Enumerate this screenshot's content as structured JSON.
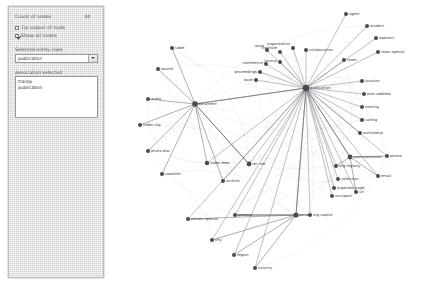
{
  "panel": {
    "count_label": "Count of nodes",
    "count_value": "44",
    "checkbox_top_label": "Tip output of node",
    "checkbox_top_checked": false,
    "checkbox_show_label": "Show all nodes",
    "checkbox_show_checked": true,
    "select_label": "Selected entity class",
    "select_value": "publication",
    "list_label": "Association selected",
    "list_items": [
      "transp",
      "publication"
    ]
  },
  "graph": {
    "accent_node_color": "#4a4a52",
    "edge_color": "#6f6f78",
    "hub_center": {
      "label": "publication",
      "x": 196,
      "y": 88
    },
    "nodes": [
      {
        "id": "n01",
        "label": "agent",
        "x": 236,
        "y": 14,
        "r": 2.0,
        "anchor": "start",
        "dx": 3,
        "dy": 1.2
      },
      {
        "id": "n02",
        "label": "student",
        "x": 257,
        "y": 26,
        "r": 2.0,
        "anchor": "start",
        "dx": 3,
        "dy": 1.2
      },
      {
        "id": "n03",
        "label": "aspirant",
        "x": 266,
        "y": 38,
        "r": 2.0,
        "anchor": "start",
        "dx": 3,
        "dy": 1.2
      },
      {
        "id": "n04",
        "label": "team special",
        "x": 268,
        "y": 52,
        "r": 2.0,
        "anchor": "start",
        "dx": 3,
        "dy": 1.2
      },
      {
        "id": "n05",
        "label": "team",
        "x": 234,
        "y": 60,
        "r": 2.0,
        "anchor": "start",
        "dx": 3,
        "dy": 1.2
      },
      {
        "id": "n06",
        "label": "location",
        "x": 252,
        "y": 81,
        "r": 2.0,
        "anchor": "start",
        "dx": 3,
        "dy": 1.2
      },
      {
        "id": "n07",
        "label": "post address",
        "x": 254,
        "y": 94,
        "r": 2.0,
        "anchor": "start",
        "dx": 3,
        "dy": 1.2
      },
      {
        "id": "n08",
        "label": "naming",
        "x": 252,
        "y": 107,
        "r": 2.0,
        "anchor": "start",
        "dx": 3,
        "dy": 1.2
      },
      {
        "id": "n09",
        "label": "calling",
        "x": 252,
        "y": 120,
        "r": 2.0,
        "anchor": "start",
        "dx": 3,
        "dy": 1.2
      },
      {
        "id": "n10",
        "label": "authorship",
        "x": 250,
        "y": 133,
        "r": 2.0,
        "anchor": "start",
        "dx": 3,
        "dy": 1.2
      },
      {
        "id": "n11",
        "label": "communication",
        "x": 240,
        "y": 157,
        "r": 2.4,
        "anchor": "start",
        "dx": 3,
        "dy": 1.2
      },
      {
        "id": "n12",
        "label": "phone",
        "x": 277,
        "y": 156,
        "r": 2.0,
        "anchor": "start",
        "dx": 3,
        "dy": 1.2
      },
      {
        "id": "n13",
        "label": "email",
        "x": 268,
        "y": 176,
        "r": 2.0,
        "anchor": "start",
        "dx": 3,
        "dy": 1.2
      },
      {
        "id": "n14",
        "label": "url",
        "x": 246,
        "y": 192,
        "r": 2.0,
        "anchor": "start",
        "dx": 3,
        "dy": 1.2
      },
      {
        "id": "n15",
        "label": "org registry",
        "x": 226,
        "y": 166,
        "r": 2.0,
        "anchor": "start",
        "dx": 3,
        "dy": 1.2
      },
      {
        "id": "n16",
        "label": "collection",
        "x": 228,
        "y": 179,
        "r": 2.0,
        "anchor": "start",
        "dx": 3,
        "dy": 1.2
      },
      {
        "id": "n17",
        "label": "organism page",
        "x": 224,
        "y": 188,
        "r": 2.0,
        "anchor": "start",
        "dx": 3,
        "dy": 1.2
      },
      {
        "id": "n18",
        "label": "occupant",
        "x": 222,
        "y": 196,
        "r": 2.0,
        "anchor": "start",
        "dx": 3,
        "dy": 1.2
      },
      {
        "id": "n19",
        "label": "org capital",
        "x": 200,
        "y": 215,
        "r": 2.0,
        "anchor": "start",
        "dx": 3,
        "dy": 1.2
      },
      {
        "id": "n20",
        "label": "person",
        "x": 186,
        "y": 215,
        "r": 2.6,
        "anchor": "start",
        "dx": 3,
        "dy": 1.2
      },
      {
        "id": "n21",
        "label": "person special",
        "x": 78,
        "y": 219,
        "r": 2.0,
        "anchor": "start",
        "dx": 3,
        "dy": 1.2
      },
      {
        "id": "n22",
        "label": "process",
        "x": 125,
        "y": 215,
        "r": 2.0,
        "anchor": "start",
        "dx": 3,
        "dy": 1.2
      },
      {
        "id": "n23",
        "label": "city",
        "x": 102,
        "y": 240,
        "r": 2.0,
        "anchor": "start",
        "dx": 3,
        "dy": 1.2
      },
      {
        "id": "n24",
        "label": "region",
        "x": 124,
        "y": 255,
        "r": 2.0,
        "anchor": "start",
        "dx": 3,
        "dy": 1.2
      },
      {
        "id": "n25",
        "label": "country",
        "x": 145,
        "y": 268,
        "r": 2.0,
        "anchor": "start",
        "dx": 3,
        "dy": 1.2
      },
      {
        "id": "n26",
        "label": "table",
        "x": 62,
        "y": 48,
        "r": 2.0,
        "anchor": "start",
        "dx": 3,
        "dy": 1.2
      },
      {
        "id": "n27",
        "label": "source",
        "x": 48,
        "y": 69,
        "r": 2.0,
        "anchor": "start",
        "dx": 3,
        "dy": 1.2
      },
      {
        "id": "n28",
        "label": "audio",
        "x": 38,
        "y": 99,
        "r": 2.0,
        "anchor": "start",
        "dx": 3,
        "dy": 1.2
      },
      {
        "id": "n29",
        "label": "video clip",
        "x": 30,
        "y": 125,
        "r": 2.0,
        "anchor": "start",
        "dx": 3,
        "dy": 1.2
      },
      {
        "id": "n30",
        "label": "photo disc",
        "x": 38,
        "y": 151,
        "r": 2.0,
        "anchor": "start",
        "dx": 3,
        "dy": 1.2
      },
      {
        "id": "n31",
        "label": "cassette",
        "x": 52,
        "y": 174,
        "r": 2.0,
        "anchor": "start",
        "dx": 3,
        "dy": 1.2
      },
      {
        "id": "n32",
        "label": "video feed",
        "x": 97,
        "y": 163,
        "r": 2.2,
        "anchor": "start",
        "dx": 3,
        "dy": 1.2
      },
      {
        "id": "n33",
        "label": "archive",
        "x": 113,
        "y": 181,
        "r": 2.0,
        "anchor": "start",
        "dx": 3,
        "dy": 1.2
      },
      {
        "id": "n34",
        "label": "document",
        "x": 85,
        "y": 104,
        "r": 2.8,
        "anchor": "start",
        "dx": 3,
        "dy": 1.2
      },
      {
        "id": "n35",
        "label": "rec ckb",
        "x": 139,
        "y": 164,
        "r": 2.4,
        "anchor": "start",
        "dx": 3,
        "dy": 1.2
      },
      {
        "id": "n36",
        "label": "publication",
        "x": 196,
        "y": 88,
        "r": 3.2,
        "anchor": "start",
        "dx": 4,
        "dy": 1.2
      },
      {
        "id": "n37",
        "label": "collaboration",
        "x": 196,
        "y": 50,
        "r": 2.0,
        "anchor": "start",
        "dx": 3,
        "dy": 1.2
      },
      {
        "id": "n38",
        "label": "organization",
        "x": 183,
        "y": 48,
        "r": 2.0,
        "anchor": "end",
        "dx": -3,
        "dy": -2.6
      },
      {
        "id": "n39",
        "label": "institute",
        "x": 170,
        "y": 52,
        "r": 2.0,
        "anchor": "end",
        "dx": -3,
        "dy": -2.6
      },
      {
        "id": "n40",
        "label": "issue",
        "x": 157,
        "y": 50,
        "r": 2.0,
        "anchor": "end",
        "dx": -3,
        "dy": -2.6
      },
      {
        "id": "n41",
        "label": "journal",
        "x": 170,
        "y": 62,
        "r": 2.0,
        "anchor": "end",
        "dx": -3,
        "dy": -0.5
      },
      {
        "id": "n42",
        "label": "conference",
        "x": 156,
        "y": 64,
        "r": 2.0,
        "anchor": "end",
        "dx": -3,
        "dy": -0.5
      },
      {
        "id": "n43",
        "label": "proceedings",
        "x": 150,
        "y": 72,
        "r": 2.0,
        "anchor": "end",
        "dx": -3,
        "dy": 1.0
      },
      {
        "id": "n44",
        "label": "book",
        "x": 146,
        "y": 80,
        "r": 2.0,
        "anchor": "end",
        "dx": -3,
        "dy": 1.0
      }
    ],
    "hub_edges": [
      "n01",
      "n02",
      "n03",
      "n04",
      "n05",
      "n06",
      "n07",
      "n08",
      "n09",
      "n10",
      "n11",
      "n15",
      "n16",
      "n17",
      "n18",
      "n19",
      "n20",
      "n35",
      "n37",
      "n38",
      "n39",
      "n40",
      "n41",
      "n42",
      "n43",
      "n44",
      "n32",
      "n34",
      "n22",
      "n33",
      "n23",
      "n24",
      "n25",
      "n12",
      "n13",
      "n14",
      "n21"
    ],
    "doc_edges": [
      "n26",
      "n27",
      "n28",
      "n29",
      "n30",
      "n31",
      "n32",
      "n33",
      "n35"
    ],
    "person_edges": [
      "n21",
      "n22",
      "n23",
      "n24",
      "n25",
      "n19"
    ],
    "comm_edges": [
      "n12",
      "n13",
      "n14",
      "n15"
    ]
  }
}
